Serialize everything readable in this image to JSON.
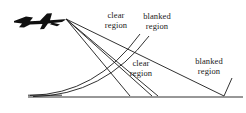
{
  "diagram": {
    "stroke_color": "#1a1a1a",
    "aircraft_color": "#101010",
    "background_color": "#ffffff",
    "labels": {
      "clear_upper": {
        "line1": "clear",
        "line2": "region"
      },
      "blanked_upper": {
        "line1": "blanked",
        "line2": "region"
      },
      "clear_lower": {
        "line1": "clear",
        "line2": "region"
      },
      "blanked_lower": {
        "line1": "blanked",
        "line2": "region"
      }
    },
    "elements": {
      "aircraft_name": "aircraft-silhouette",
      "ground_line_name": "ground-line",
      "ray_fan_name": "sensor-ray-fan",
      "curve_name": "coverage-boundary-curve"
    }
  }
}
